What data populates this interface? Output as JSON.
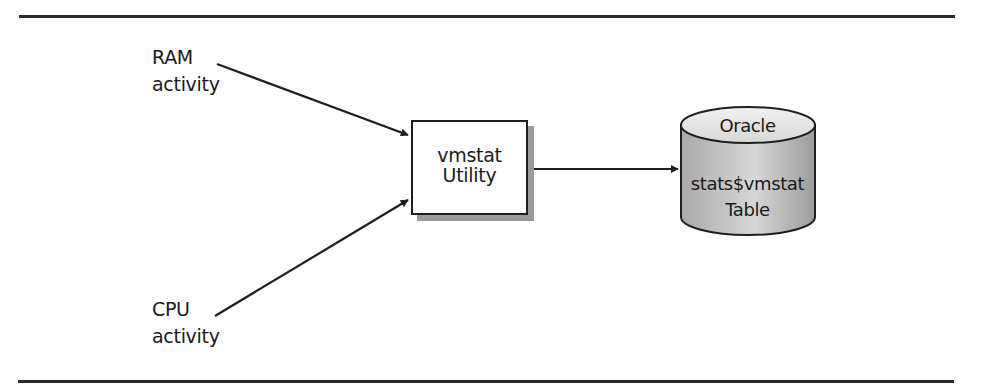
{
  "diagram": {
    "type": "data-flow",
    "inputs": [
      {
        "id": "ram",
        "lines": [
          "RAM",
          "activity"
        ]
      },
      {
        "id": "cpu",
        "lines": [
          "CPU",
          "activity"
        ]
      }
    ],
    "process": {
      "id": "vmstat",
      "lines": [
        "vmstat",
        "Utility"
      ],
      "shape": "rectangle-with-shadow"
    },
    "store": {
      "id": "oracle-table",
      "title": "Oracle",
      "lines": [
        "stats$vmstat",
        "Table"
      ],
      "shape": "cylinder"
    },
    "edges": [
      {
        "from": "ram",
        "to": "vmstat"
      },
      {
        "from": "cpu",
        "to": "vmstat"
      },
      {
        "from": "vmstat",
        "to": "oracle-table"
      }
    ]
  },
  "colors": {
    "line": "#1e1e1e",
    "shadow": "#9a9a9a",
    "cylinder_fill": "#b8b8b8",
    "cylinder_top": "#e2e2e2",
    "background": "#ffffff"
  }
}
